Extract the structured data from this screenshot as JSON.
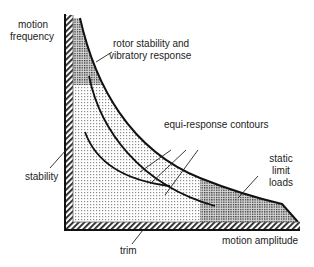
{
  "diagram": {
    "axes": {
      "y_label_line1": "motion",
      "y_label_line2": "frequency",
      "x_label": "motion amplitude"
    },
    "regions": {
      "rotor": {
        "line1": "rotor stability and",
        "line2": "vibratory response"
      },
      "contours": {
        "label": "equi-response contours"
      },
      "static": {
        "line1": "static",
        "line2": "limit",
        "line3": "loads"
      },
      "stability": {
        "label": "stability"
      },
      "trim": {
        "label": "trim"
      }
    },
    "colors": {
      "line": "#111111",
      "light_dots": "#9a9a9a",
      "dark_dots": "#555555",
      "background": "#ffffff"
    }
  }
}
